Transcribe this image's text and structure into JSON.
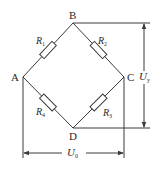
{
  "diagram": {
    "type": "wheatstone-bridge",
    "nodes": {
      "A": {
        "label": "A"
      },
      "B": {
        "label": "B"
      },
      "C": {
        "label": "C"
      },
      "D": {
        "label": "D"
      }
    },
    "resistors": [
      {
        "id": "R1",
        "symbol": "R",
        "subscript": "1",
        "between": [
          "A",
          "B"
        ]
      },
      {
        "id": "R2",
        "symbol": "R",
        "subscript": "2",
        "between": [
          "B",
          "C"
        ]
      },
      {
        "id": "R3",
        "symbol": "R",
        "subscript": "3",
        "between": [
          "C",
          "D"
        ]
      },
      {
        "id": "R4",
        "symbol": "R",
        "subscript": "4",
        "between": [
          "A",
          "D"
        ]
      }
    ],
    "voltages": {
      "output": {
        "symbol": "U",
        "subscript": "y",
        "between": [
          "B",
          "D"
        ],
        "orientation": "vertical"
      },
      "input": {
        "symbol": "U",
        "subscript": "0",
        "between": [
          "A",
          "C"
        ],
        "orientation": "horizontal"
      }
    },
    "colors": {
      "line": "#3a3a3a",
      "background": "#ffffff"
    }
  }
}
